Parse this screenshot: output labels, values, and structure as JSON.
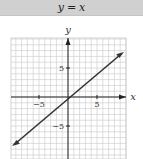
{
  "title": {
    "lhs": "y",
    "eq": "=",
    "rhs": "x"
  },
  "axes": {
    "x_label": "x",
    "y_label": "y"
  },
  "ticks": {
    "x_neg": "−5",
    "x_pos": "5",
    "y_pos": "5",
    "y_neg": "−5"
  },
  "colors": {
    "title_bg": "#d0d0d0",
    "grid": "#c8c8c8",
    "axis": "#222222",
    "line": "#333333"
  },
  "chart_data": {
    "type": "line",
    "title": "y = x",
    "xlabel": "x",
    "ylabel": "y",
    "xlim": [
      -10,
      10
    ],
    "ylim": [
      -10,
      10
    ],
    "grid": true,
    "x_ticks": [
      -5,
      5
    ],
    "y_ticks": [
      -5,
      5
    ],
    "series": [
      {
        "name": "y = x",
        "x": [
          -9.5,
          0,
          9.5
        ],
        "y": [
          -9.5,
          0,
          9.5
        ],
        "arrows": "both"
      }
    ]
  }
}
